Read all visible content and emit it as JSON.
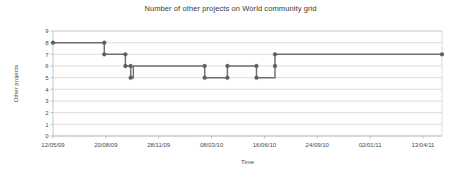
{
  "chart_data": {
    "type": "line",
    "step": "post",
    "title": "Number of other projects on World community grid",
    "xlabel": "Time",
    "ylabel": "Other projects",
    "grid": true,
    "legend": false,
    "ylim": [
      0,
      9
    ],
    "yticks": [
      0,
      1,
      2,
      3,
      4,
      5,
      6,
      7,
      8,
      9
    ],
    "ytick_labels": [
      "0",
      "1",
      "2",
      "3",
      "4",
      "5",
      "6",
      "7",
      "8",
      "9"
    ],
    "xtick_labels": [
      "12/05/09",
      "20/08/09",
      "28/11/09",
      "08/03/10",
      "16/06/10",
      "24/09/10",
      "02/01/11",
      "13/04/11"
    ],
    "xtick_positions_days": [
      0,
      100,
      200,
      300,
      400,
      500,
      600,
      700
    ],
    "xlim_days": [
      0,
      736
    ],
    "series": [
      {
        "name": "Other projects",
        "color": "#6f6f6f",
        "x_days": [
          0,
          97,
          97,
          137,
          137,
          147,
          147,
          152,
          152,
          287,
          287,
          330,
          330,
          385,
          385,
          420,
          420,
          736
        ],
        "x_labels": [
          "12/05/09",
          "17/08/09",
          "17/08/09",
          "26/09/09",
          "26/09/09",
          "06/10/09",
          "06/10/09",
          "11/10/09",
          "11/10/09",
          "23/02/10",
          "23/02/10",
          "07/04/10",
          "07/04/10",
          "01/06/10",
          "01/06/10",
          "06/07/10",
          "06/07/10",
          "18/05/11"
        ],
        "y_values": [
          8,
          8,
          7,
          7,
          6,
          6,
          5,
          5,
          6,
          6,
          5,
          5,
          6,
          6,
          5,
          5,
          7,
          7
        ],
        "marker_points": [
          {
            "x_days": 0,
            "y": 8
          },
          {
            "x_days": 97,
            "y": 8
          },
          {
            "x_days": 97,
            "y": 7
          },
          {
            "x_days": 137,
            "y": 7
          },
          {
            "x_days": 137,
            "y": 6
          },
          {
            "x_days": 147,
            "y": 6
          },
          {
            "x_days": 147,
            "y": 5
          },
          {
            "x_days": 287,
            "y": 5
          },
          {
            "x_days": 287,
            "y": 6
          },
          {
            "x_days": 330,
            "y": 6
          },
          {
            "x_days": 330,
            "y": 5
          },
          {
            "x_days": 385,
            "y": 5
          },
          {
            "x_days": 385,
            "y": 6
          },
          {
            "x_days": 420,
            "y": 6
          },
          {
            "x_days": 420,
            "y": 7
          },
          {
            "x_days": 736,
            "y": 7
          }
        ]
      }
    ]
  }
}
